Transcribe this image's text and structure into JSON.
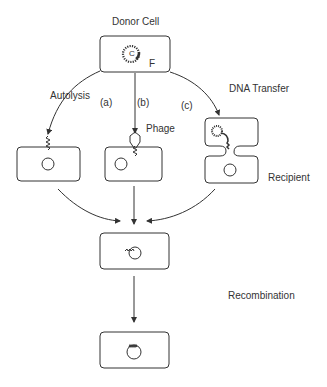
{
  "diagram": {
    "title": "Donor Cell",
    "donor_plasmid_label": "C",
    "donor_factor_label": "F",
    "pathways": [
      {
        "id": "a",
        "marker": "(a)",
        "name": "Autolysis"
      },
      {
        "id": "b",
        "marker": "(b)",
        "name": "Phage"
      },
      {
        "id": "c",
        "marker": "(c)",
        "name": "DNA Transfer"
      }
    ],
    "recipient_label": "Recipient",
    "final_step_label": "Recombination",
    "colors": {
      "stroke": "#333333",
      "background": "#ffffff"
    }
  }
}
